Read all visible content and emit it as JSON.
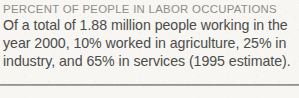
{
  "card": {
    "background_color": "#f7f6f3",
    "heading": {
      "text": "PERCENT OF PEOPLE IN LABOR OCCUPATIONS",
      "color": "#8d8d8a"
    },
    "body": {
      "color": "#4c4c49",
      "lines": [
        "Of a total of 1.88 million people working in the",
        "year 2000, 10% worked in agriculture, 25% in",
        "industry, and 65% in services (1995 estimate)."
      ],
      "full_text": "Of a total of 1.88 million people working in the year 2000, 10% worked in agriculture, 25% in industry, and 65% in services (1995 estimate)."
    },
    "divider": {
      "color": "#8a8a87"
    },
    "facts": {
      "total_workforce": "1.88 million",
      "reference_year": "2000",
      "estimate_year": "1995",
      "agriculture_percent": "10%",
      "industry_percent": "25%",
      "services_percent": "65%"
    }
  }
}
